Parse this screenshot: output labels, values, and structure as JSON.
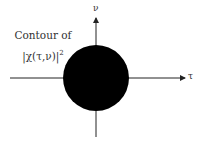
{
  "diagram": {
    "caption_line1": "Contour of",
    "caption_line2": "|χ(τ,ν)|",
    "caption_exponent": "2",
    "axes": {
      "x_label": "τ",
      "y_label": "ν"
    },
    "shape": {
      "type": "filled-circle",
      "fill_color": "#000000",
      "center": [
        96,
        78
      ],
      "radius": 33
    },
    "line_color": "#222222"
  }
}
